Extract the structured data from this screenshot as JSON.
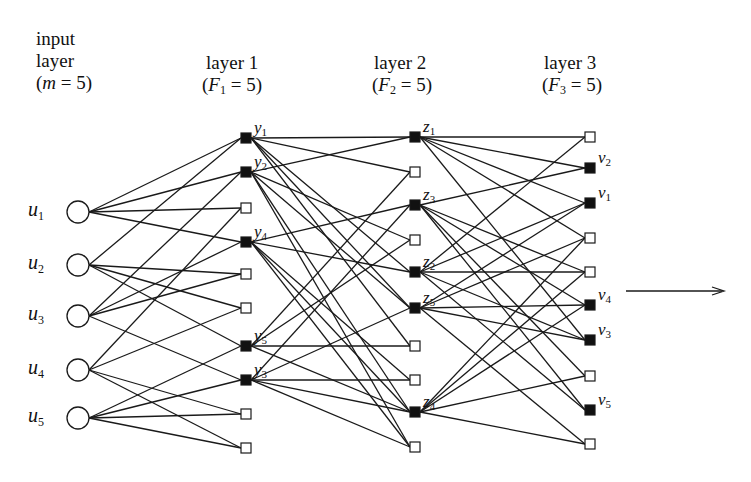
{
  "headers": {
    "input": {
      "line1": "input",
      "line2": "layer",
      "param": "m",
      "eq": " = 5)"
    },
    "layer1": {
      "title": "layer 1",
      "param": "F",
      "sub": "1",
      "eq": " = 5)"
    },
    "layer2": {
      "title": "layer 2",
      "param": "F",
      "sub": "2",
      "eq": " = 5)"
    },
    "layer3": {
      "title": "layer 3",
      "param": "F",
      "sub": "3",
      "eq": " = 5)"
    }
  },
  "colors": {
    "line": "#1a1a1a",
    "filled": "#111111",
    "empty_fill": "#ffffff"
  },
  "input_nodes": [
    {
      "base": "u",
      "sub": "1",
      "x": 78,
      "y": 212
    },
    {
      "base": "u",
      "sub": "2",
      "x": 78,
      "y": 265
    },
    {
      "base": "u",
      "sub": "3",
      "x": 78,
      "y": 316
    },
    {
      "base": "u",
      "sub": "4",
      "x": 78,
      "y": 370
    },
    {
      "base": "u",
      "sub": "5",
      "x": 78,
      "y": 418
    }
  ],
  "layers": [
    {
      "name": "layer1",
      "x": 246,
      "ys": [
        138,
        172,
        208,
        242,
        274,
        308,
        346,
        380,
        414,
        448
      ],
      "filled": [
        true,
        true,
        false,
        true,
        false,
        false,
        true,
        true,
        false,
        false
      ],
      "labels": [
        {
          "base": "y",
          "sub": "1"
        },
        {
          "base": "y",
          "sub": "2"
        },
        null,
        {
          "base": "y",
          "sub": "4"
        },
        null,
        null,
        {
          "base": "y",
          "sub": "5"
        },
        {
          "base": "y",
          "sub": "3"
        },
        null,
        null
      ]
    },
    {
      "name": "layer2",
      "x": 415,
      "ys": [
        137,
        172,
        205,
        240,
        272,
        308,
        346,
        380,
        412,
        447
      ],
      "filled": [
        true,
        false,
        true,
        false,
        true,
        true,
        false,
        false,
        true,
        false
      ],
      "labels": [
        {
          "base": "z",
          "sub": "1"
        },
        null,
        {
          "base": "z",
          "sub": "3"
        },
        null,
        {
          "base": "z",
          "sub": "2"
        },
        {
          "base": "z",
          "sub": "5"
        },
        null,
        null,
        {
          "base": "z",
          "sub": "4"
        },
        null
      ]
    },
    {
      "name": "layer3",
      "x": 590,
      "ys": [
        137,
        168,
        203,
        238,
        272,
        305,
        340,
        376,
        410,
        444
      ],
      "filled": [
        false,
        true,
        true,
        false,
        false,
        true,
        true,
        false,
        true,
        false
      ],
      "labels": [
        null,
        {
          "base": "v",
          "sub": "2"
        },
        {
          "base": "v",
          "sub": "1"
        },
        null,
        null,
        {
          "base": "v",
          "sub": "4"
        },
        {
          "base": "v",
          "sub": "3"
        },
        null,
        {
          "base": "v",
          "sub": "5"
        },
        null
      ]
    }
  ],
  "edges": {
    "input_to_l1": [
      [
        0,
        0
      ],
      [
        0,
        1
      ],
      [
        0,
        2
      ],
      [
        0,
        3
      ],
      [
        1,
        0
      ],
      [
        1,
        4
      ],
      [
        1,
        5
      ],
      [
        1,
        6
      ],
      [
        2,
        1
      ],
      [
        2,
        3
      ],
      [
        2,
        4
      ],
      [
        2,
        7
      ],
      [
        3,
        2
      ],
      [
        3,
        5
      ],
      [
        3,
        8
      ],
      [
        3,
        9
      ],
      [
        4,
        6
      ],
      [
        4,
        7
      ],
      [
        4,
        8
      ],
      [
        4,
        9
      ]
    ],
    "l1_to_l2": [
      [
        0,
        0
      ],
      [
        0,
        1
      ],
      [
        0,
        4
      ],
      [
        0,
        6
      ],
      [
        0,
        5
      ],
      [
        1,
        0
      ],
      [
        1,
        3
      ],
      [
        1,
        5
      ],
      [
        1,
        8
      ],
      [
        1,
        9
      ],
      [
        3,
        2
      ],
      [
        3,
        4
      ],
      [
        3,
        7
      ],
      [
        3,
        8
      ],
      [
        3,
        9
      ],
      [
        6,
        1
      ],
      [
        6,
        3
      ],
      [
        6,
        6
      ],
      [
        6,
        8
      ],
      [
        7,
        2
      ],
      [
        7,
        5
      ],
      [
        7,
        7
      ],
      [
        7,
        8
      ],
      [
        7,
        9
      ]
    ],
    "l2_to_l3": [
      [
        0,
        0
      ],
      [
        0,
        1
      ],
      [
        0,
        3
      ],
      [
        0,
        6
      ],
      [
        0,
        2
      ],
      [
        2,
        1
      ],
      [
        2,
        4
      ],
      [
        2,
        5
      ],
      [
        2,
        7
      ],
      [
        2,
        8
      ],
      [
        4,
        0
      ],
      [
        4,
        4
      ],
      [
        4,
        6
      ],
      [
        4,
        8
      ],
      [
        4,
        2
      ],
      [
        5,
        2
      ],
      [
        5,
        5
      ],
      [
        5,
        6
      ],
      [
        5,
        9
      ],
      [
        5,
        3
      ],
      [
        8,
        3
      ],
      [
        8,
        4
      ],
      [
        8,
        7
      ],
      [
        8,
        9
      ],
      [
        8,
        5
      ]
    ]
  },
  "output_arrow": {
    "x1": 626,
    "y1": 291,
    "x2": 724,
    "y2": 291
  }
}
